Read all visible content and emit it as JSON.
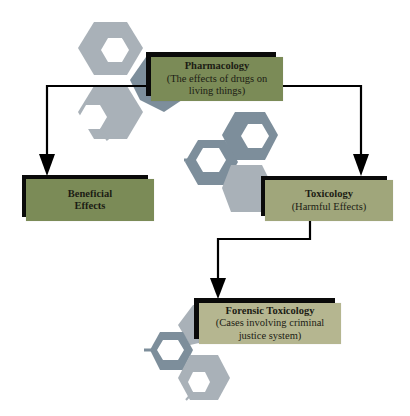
{
  "diagram": {
    "type": "flowchart",
    "nodes": {
      "pharmacology": {
        "title": "Pharmacology",
        "subtitle_line1": "(The effects of drugs on",
        "subtitle_line2": "living things)",
        "color": "#7b8b57"
      },
      "beneficial": {
        "title_line1": "Beneficial",
        "title_line2": "Effects",
        "color": "#7b8b57"
      },
      "toxicology": {
        "title": "Toxicology",
        "subtitle": "(Harmful Effects)",
        "color": "#a0a67b"
      },
      "forensic": {
        "title": "Forensic Toxicology",
        "subtitle_line1": "(Cases involving criminal",
        "subtitle_line2": "justice system)",
        "color": "#b5b690"
      }
    },
    "edges": [
      {
        "from": "Pharmacology",
        "to": "Beneficial Effects"
      },
      {
        "from": "Pharmacology",
        "to": "Toxicology"
      },
      {
        "from": "Toxicology",
        "to": "Forensic Toxicology"
      }
    ],
    "decor": {
      "hex_light": "#a9b1b8",
      "hex_dark": "#7d8e9b",
      "line_color": "#000000"
    }
  }
}
